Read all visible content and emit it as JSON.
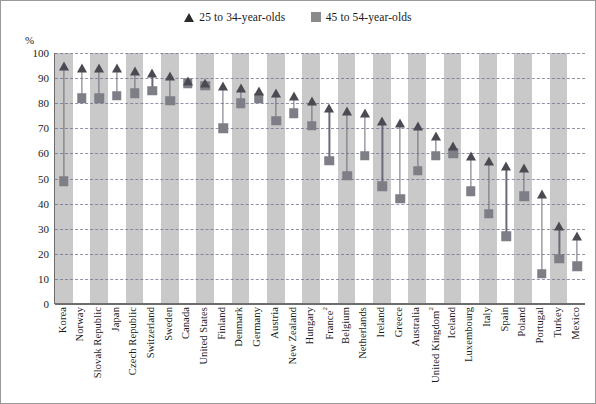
{
  "axis": {
    "unit_label": "%",
    "y_ticks": [
      0,
      10,
      20,
      30,
      40,
      50,
      60,
      70,
      80,
      90,
      100
    ]
  },
  "legend": {
    "items": [
      {
        "marker": "triangle-marker",
        "label": "25 to 34-year-olds",
        "color": "#2b2b2b"
      },
      {
        "marker": "square-marker",
        "label": "45 to 54-year-olds",
        "color": "#8a8a8a"
      }
    ]
  },
  "chart_data": {
    "type": "scatter",
    "title": "",
    "subtitle": "",
    "xlabel": "",
    "ylabel": "%",
    "ylim": [
      0,
      100
    ],
    "grid": true,
    "legend_position": "top-center",
    "categories": [
      "Korea",
      "Norway",
      "Slovak Republic",
      "Japan",
      "Czech Republic",
      "Switzerland",
      "Sweden",
      "Canada",
      "United States",
      "Finland",
      "Denmark",
      "Germany",
      "Austria",
      "New Zealand",
      "Hungary",
      "France",
      "Belgium",
      "Netherlands",
      "Ireland",
      "Greece",
      "Australia",
      "United Kingdom",
      "Iceland",
      "Luxembourg",
      "Italy",
      "Spain",
      "Poland",
      "Portugal",
      "Turkey",
      "Mexico"
    ],
    "category_footnotes": {
      "France": "2",
      "United Kingdom": "2"
    },
    "series": [
      {
        "name": "25 to 34-year-olds",
        "marker": "triangle",
        "color": "#4a4a52",
        "values": [
          95,
          94,
          94,
          94,
          93,
          92,
          91,
          89,
          88,
          87,
          86,
          85,
          84,
          83,
          81,
          78,
          77,
          76,
          73,
          72,
          71,
          67,
          63,
          59,
          57,
          55,
          54,
          44,
          31,
          27
        ]
      },
      {
        "name": "45 to 54-year-olds",
        "marker": "square",
        "color": "#7e7e86",
        "values": [
          49,
          82,
          82,
          83,
          84,
          85,
          81,
          88,
          87,
          70,
          80,
          82,
          73,
          76,
          71,
          57,
          51,
          59,
          47,
          42,
          53,
          59,
          60,
          45,
          36,
          27,
          43,
          12,
          18,
          15
        ]
      }
    ]
  }
}
